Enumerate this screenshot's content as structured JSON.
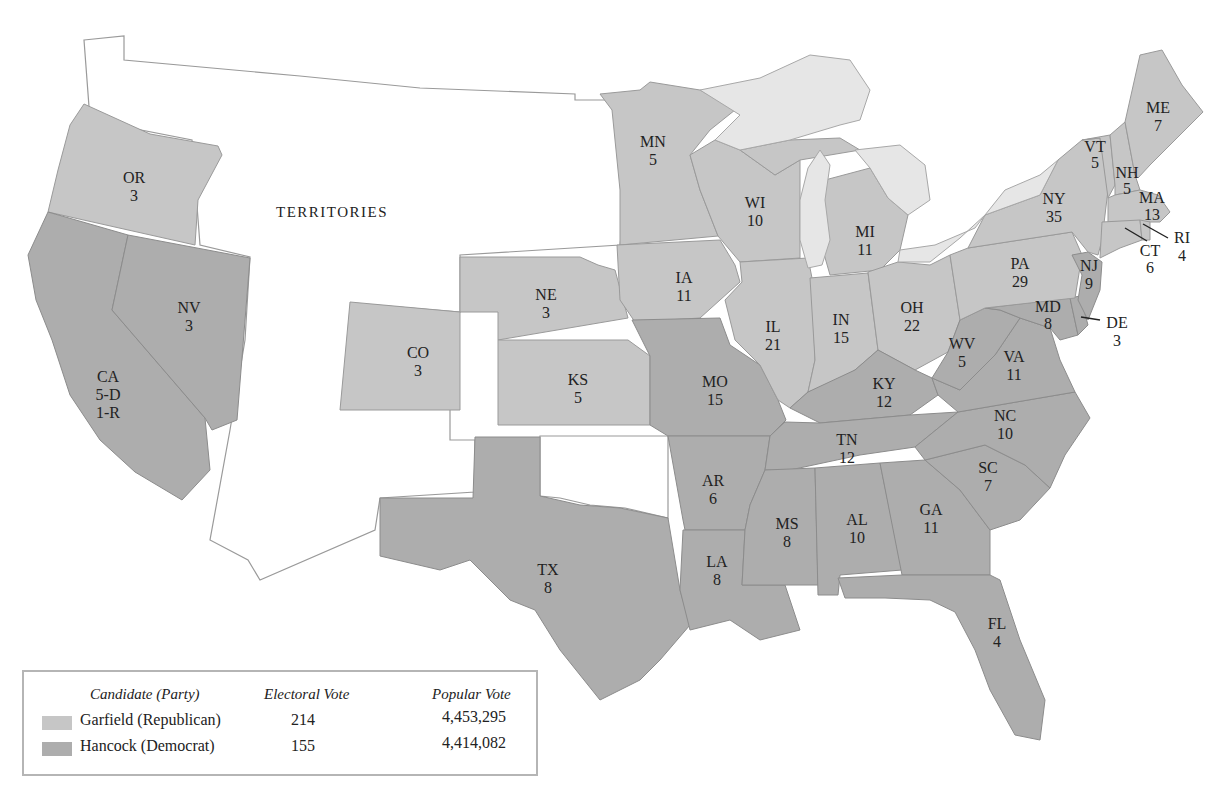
{
  "map": {
    "territories_label": "TERRITORIES",
    "colors": {
      "republican": "#c6c6c6",
      "democrat": "#adadad",
      "territory": "#ffffff",
      "lakes": "#e6e6e6"
    },
    "states": {
      "OR": {
        "abbr": "OR",
        "votes": "3",
        "party": "Republican"
      },
      "CA": {
        "abbr": "CA",
        "votes": "5-D",
        "votes2": "1-R",
        "party": "Democrat"
      },
      "NV": {
        "abbr": "NV",
        "votes": "3",
        "party": "Democrat"
      },
      "CO": {
        "abbr": "CO",
        "votes": "3",
        "party": "Republican"
      },
      "NE": {
        "abbr": "NE",
        "votes": "3",
        "party": "Republican"
      },
      "KS": {
        "abbr": "KS",
        "votes": "5",
        "party": "Republican"
      },
      "TX": {
        "abbr": "TX",
        "votes": "8",
        "party": "Democrat"
      },
      "MN": {
        "abbr": "MN",
        "votes": "5",
        "party": "Republican"
      },
      "IA": {
        "abbr": "IA",
        "votes": "11",
        "party": "Republican"
      },
      "MO": {
        "abbr": "MO",
        "votes": "15",
        "party": "Democrat"
      },
      "AR": {
        "abbr": "AR",
        "votes": "6",
        "party": "Democrat"
      },
      "LA": {
        "abbr": "LA",
        "votes": "8",
        "party": "Democrat"
      },
      "WI": {
        "abbr": "WI",
        "votes": "10",
        "party": "Republican"
      },
      "IL": {
        "abbr": "IL",
        "votes": "21",
        "party": "Republican"
      },
      "MI": {
        "abbr": "MI",
        "votes": "11",
        "party": "Republican"
      },
      "IN": {
        "abbr": "IN",
        "votes": "15",
        "party": "Republican"
      },
      "OH": {
        "abbr": "OH",
        "votes": "22",
        "party": "Republican"
      },
      "KY": {
        "abbr": "KY",
        "votes": "12",
        "party": "Democrat"
      },
      "TN": {
        "abbr": "TN",
        "votes": "12",
        "party": "Democrat"
      },
      "MS": {
        "abbr": "MS",
        "votes": "8",
        "party": "Democrat"
      },
      "AL": {
        "abbr": "AL",
        "votes": "10",
        "party": "Democrat"
      },
      "GA": {
        "abbr": "GA",
        "votes": "11",
        "party": "Democrat"
      },
      "FL": {
        "abbr": "FL",
        "votes": "4",
        "party": "Democrat"
      },
      "SC": {
        "abbr": "SC",
        "votes": "7",
        "party": "Democrat"
      },
      "NC": {
        "abbr": "NC",
        "votes": "10",
        "party": "Democrat"
      },
      "VA": {
        "abbr": "VA",
        "votes": "11",
        "party": "Democrat"
      },
      "WV": {
        "abbr": "WV",
        "votes": "5",
        "party": "Democrat"
      },
      "MD": {
        "abbr": "MD",
        "votes": "8",
        "party": "Democrat"
      },
      "DE": {
        "abbr": "DE",
        "votes": "3",
        "party": "Democrat"
      },
      "PA": {
        "abbr": "PA",
        "votes": "29",
        "party": "Republican"
      },
      "NJ": {
        "abbr": "NJ",
        "votes": "9",
        "party": "Democrat"
      },
      "NY": {
        "abbr": "NY",
        "votes": "35",
        "party": "Republican"
      },
      "VT": {
        "abbr": "VT",
        "votes": "5",
        "party": "Republican"
      },
      "NH": {
        "abbr": "NH",
        "votes": "5",
        "party": "Republican"
      },
      "ME": {
        "abbr": "ME",
        "votes": "7",
        "party": "Republican"
      },
      "MA": {
        "abbr": "MA",
        "votes": "13",
        "party": "Republican"
      },
      "RI": {
        "abbr": "RI",
        "votes": "4",
        "party": "Republican"
      },
      "CT": {
        "abbr": "CT",
        "votes": "6",
        "party": "Republican"
      }
    }
  },
  "legend": {
    "headers": {
      "candidate": "Candidate (Party)",
      "electoral": "Electoral Vote",
      "popular": "Popular Vote"
    },
    "rows": [
      {
        "candidate": "Garfield (Republican)",
        "electoral": "214",
        "popular": "4,453,295",
        "color": "#c6c6c6"
      },
      {
        "candidate": "Hancock (Democrat)",
        "electoral": "155",
        "popular": "4,414,082",
        "color": "#adadad"
      }
    ]
  }
}
